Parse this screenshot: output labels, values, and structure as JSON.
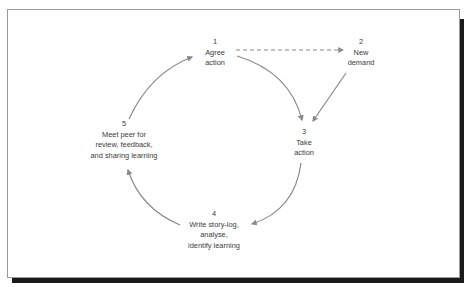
{
  "diagram": {
    "type": "cycle",
    "colors": {
      "arrow": "#8a8a8a",
      "text": "#3a3a3a",
      "frame_border": "#9a9a9a",
      "shadow": "#1a1a1a"
    },
    "nodes": [
      {
        "id": "1",
        "number": "1",
        "lines": [
          "Agree",
          "action"
        ]
      },
      {
        "id": "2",
        "number": "2",
        "lines": [
          "New",
          "demand"
        ]
      },
      {
        "id": "3",
        "number": "3",
        "lines": [
          "Take",
          "action"
        ]
      },
      {
        "id": "4",
        "number": "4",
        "lines": [
          "Write story-log,",
          "analyse,",
          "identify learning"
        ]
      },
      {
        "id": "5",
        "number": "5",
        "lines": [
          "Meet peer for",
          "review, feedback,",
          "and sharing learning"
        ]
      }
    ],
    "edges": [
      {
        "from": "1",
        "to": "2",
        "style": "dashed"
      },
      {
        "from": "1",
        "to": "3",
        "style": "solid"
      },
      {
        "from": "2",
        "to": "3",
        "style": "solid"
      },
      {
        "from": "3",
        "to": "4",
        "style": "solid"
      },
      {
        "from": "4",
        "to": "5",
        "style": "solid"
      },
      {
        "from": "5",
        "to": "1",
        "style": "solid"
      }
    ]
  }
}
